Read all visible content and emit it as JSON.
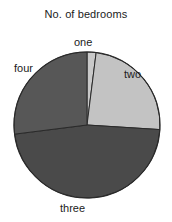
{
  "chart_data": {
    "type": "pie",
    "title": "No. of bedrooms",
    "categories": [
      "one",
      "two",
      "three",
      "four"
    ],
    "values": [
      2,
      24,
      47,
      27
    ],
    "unit": "percent",
    "labels": [
      "one",
      "two",
      "three",
      "four"
    ],
    "colors": [
      "#c9c9c9",
      "#c3c3c3",
      "#4a4a4a",
      "#575757"
    ],
    "start_angle_deg": 0,
    "direction": "clockwise",
    "slice_angles_deg": [
      7,
      87,
      168,
      98
    ],
    "legend": "none",
    "grid": false,
    "xlabel": "",
    "ylabel": "",
    "annotations": [
      {
        "text": "one",
        "position": "top"
      },
      {
        "text": "two",
        "position": "right"
      },
      {
        "text": "three",
        "position": "bottom"
      },
      {
        "text": "four",
        "position": "left"
      }
    ]
  },
  "figure": {
    "title": "No. of bedrooms",
    "label_one": "one",
    "label_two": "two",
    "label_three": "three",
    "label_four": "four"
  }
}
